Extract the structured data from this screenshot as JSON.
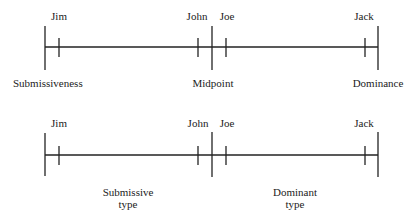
{
  "diagrams": [
    {
      "id": "continuum",
      "people": [
        {
          "name": "Jim",
          "x": 59
        },
        {
          "name": "John",
          "x": 198
        },
        {
          "name": "Joe",
          "x": 226
        },
        {
          "name": "Jack",
          "x": 365
        }
      ],
      "axis_labels": {
        "left": "Submissiveness",
        "middle": "Midpoint",
        "right": "Dominance"
      }
    },
    {
      "id": "typology",
      "people": [
        {
          "name": "Jim",
          "x": 59
        },
        {
          "name": "John",
          "x": 198
        },
        {
          "name": "Joe",
          "x": 226
        },
        {
          "name": "Jack",
          "x": 365
        }
      ],
      "categories": {
        "left": {
          "line1": "Submissive",
          "line2": "type"
        },
        "right": {
          "line1": "Dominant",
          "line2": "type"
        }
      }
    }
  ],
  "colors": {
    "line": "#222222",
    "background": "#ffffff"
  }
}
